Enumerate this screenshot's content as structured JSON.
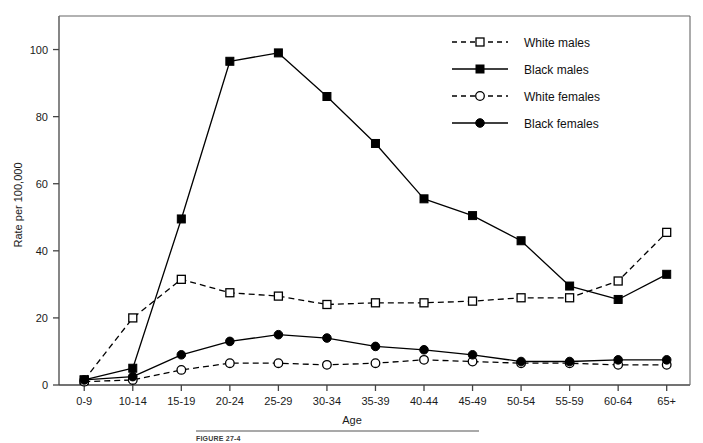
{
  "figure": {
    "caption_label": "FIGURE 27-4"
  },
  "chart_data": {
    "type": "line",
    "title": "",
    "xlabel": "Age",
    "ylabel": "Rate per 100,000",
    "categories": [
      "0-9",
      "10-14",
      "15-19",
      "20-24",
      "25-29",
      "30-34",
      "35-39",
      "40-44",
      "45-49",
      "50-54",
      "55-59",
      "60-64",
      "65+"
    ],
    "ylim": [
      0,
      110
    ],
    "yticks": [
      0,
      20,
      40,
      60,
      80,
      100
    ],
    "ytick_labels": [
      "0",
      "20",
      "40",
      "60",
      "80",
      "100"
    ],
    "grid": false,
    "legend_position": "top-right",
    "series": [
      {
        "name": "White males",
        "marker": "open-square",
        "line": "dashed",
        "values": [
          1.5,
          20.0,
          31.5,
          27.5,
          26.5,
          24.0,
          24.5,
          24.5,
          25.0,
          26.0,
          26.0,
          31.0,
          45.5
        ]
      },
      {
        "name": "Black males",
        "marker": "filled-square",
        "line": "solid",
        "values": [
          1.5,
          5.0,
          49.5,
          96.5,
          99.0,
          86.0,
          72.0,
          55.5,
          50.5,
          43.0,
          29.5,
          25.5,
          33.0
        ]
      },
      {
        "name": "White females",
        "marker": "open-circle",
        "line": "dashed",
        "values": [
          1.0,
          1.5,
          4.5,
          6.5,
          6.5,
          6.0,
          6.5,
          7.5,
          7.0,
          6.5,
          6.5,
          6.0,
          6.0
        ]
      },
      {
        "name": "Black females",
        "marker": "filled-circle",
        "line": "solid",
        "values": [
          1.5,
          2.5,
          9.0,
          13.0,
          15.0,
          14.0,
          11.5,
          10.5,
          9.0,
          7.0,
          7.0,
          7.5,
          7.5
        ]
      }
    ]
  }
}
